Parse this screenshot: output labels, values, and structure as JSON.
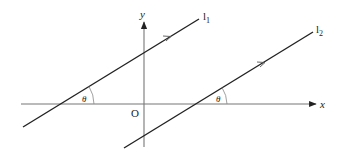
{
  "diagram": {
    "title": "",
    "axes": {
      "x_label": "x",
      "y_label": "y",
      "origin_label": "O"
    },
    "lines": [
      {
        "id": "l1",
        "label": "l",
        "subscript": "1"
      },
      {
        "id": "l2",
        "label": "l",
        "subscript": "2"
      }
    ],
    "angles": [
      {
        "label": "θ",
        "at": "l1 x-intercept"
      },
      {
        "label": "θ",
        "at": "l2 x-intercept"
      }
    ],
    "colors": {
      "axis": "#666666",
      "line": "#222222",
      "text": "#222222"
    }
  }
}
